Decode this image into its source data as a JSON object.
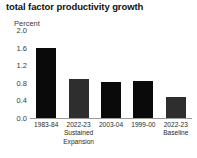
{
  "chart_data": {
    "type": "bar",
    "title": "total factor productivity growth",
    "xlabel": "",
    "ylabel": "Percent",
    "ylim": [
      0.0,
      2.0
    ],
    "yticks": [
      "2.0",
      "1.6",
      "1.2",
      "0.8",
      "0.4",
      "0.0"
    ],
    "ytick_values": [
      2.0,
      1.6,
      1.2,
      0.8,
      0.4,
      0.0
    ],
    "grid": false,
    "legend": "none",
    "categories": [
      "1983-84",
      "2022-23 Sustained Expansion",
      "2003-04",
      "1999-00",
      "2022-23 Baseline"
    ],
    "category_lines": [
      {
        "line1": "1983-84",
        "line2": "",
        "line3": ""
      },
      {
        "line1": "2022-23",
        "line2": "Sustained",
        "line3": "Expansion"
      },
      {
        "line1": "2003-04",
        "line2": "",
        "line3": ""
      },
      {
        "line1": "1999-00",
        "line2": "",
        "line3": ""
      },
      {
        "line1": "2022-23",
        "line2": "Baseline",
        "line3": ""
      }
    ],
    "values": [
      1.58,
      0.89,
      0.81,
      0.83,
      0.48
    ],
    "bar_colors": [
      "#0a0a0a",
      "#2e2e2e",
      "#0a0a0a",
      "#0a0a0a",
      "#2e2e2e"
    ]
  },
  "colors": {
    "background": "#ffffff",
    "text": "#1a1a1a",
    "axis": "#9a9a9a",
    "bar_primary": "#0a0a0a",
    "bar_secondary": "#2e2e2e"
  }
}
